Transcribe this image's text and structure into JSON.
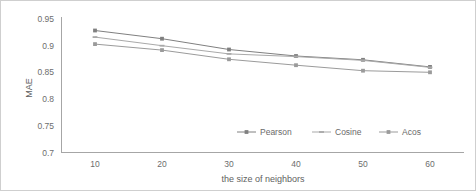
{
  "chart_data": {
    "type": "line",
    "title": "",
    "subtitle": "",
    "xlabel": "the size of neighbors",
    "ylabel": "MAE",
    "categories": [
      10,
      20,
      30,
      40,
      50,
      60
    ],
    "x": [
      10,
      20,
      30,
      40,
      50,
      60
    ],
    "xtick_labels": [
      "10",
      "20",
      "30",
      "40",
      "50",
      "60"
    ],
    "ytick_labels": [
      "0.7",
      "0.75",
      "0.8",
      "0.85",
      "0.9",
      "0.95"
    ],
    "ytick_values": [
      0.7,
      0.75,
      0.8,
      0.85,
      0.9,
      0.95
    ],
    "ylim": [
      0.7,
      0.95
    ],
    "xlim": [
      5,
      65
    ],
    "grid": false,
    "legend_position": "inside-bottom-right",
    "series": [
      {
        "name": "Pearson",
        "color": "#808080",
        "marker": "square",
        "values": [
          0.925,
          0.91,
          0.89,
          0.878,
          0.871,
          0.858
        ]
      },
      {
        "name": "Cosine",
        "color": "#a9a9a9",
        "marker": "dash",
        "values": [
          0.913,
          0.897,
          0.882,
          0.877,
          0.87,
          0.857
        ]
      },
      {
        "name": "Acos",
        "color": "#9b9b9b",
        "marker": "square",
        "values": [
          0.9,
          0.889,
          0.872,
          0.861,
          0.851,
          0.848
        ]
      }
    ]
  },
  "axes": {
    "ylabel": "MAE",
    "xlabel": "the size of neighbors"
  },
  "legend": {
    "items": [
      {
        "label": "Pearson"
      },
      {
        "label": "Cosine"
      },
      {
        "label": "Acos"
      }
    ]
  }
}
